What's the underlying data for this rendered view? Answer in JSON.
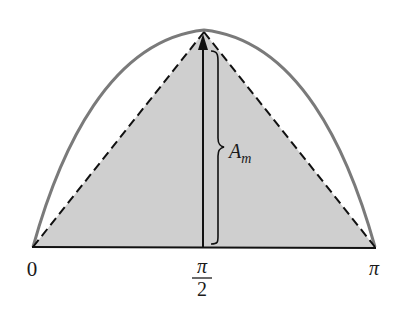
{
  "figure": {
    "type": "diagram",
    "colors": {
      "curve": "#7a7a7a",
      "triangle_fill": "#cfcfcf",
      "lines": "#111111",
      "background": "#ffffff"
    },
    "x_axis": {
      "ticks": [
        {
          "label": "0",
          "position": 0
        },
        {
          "label_numerator": "π",
          "label_denominator": "2",
          "position": 0.5
        },
        {
          "label": "π",
          "position": 1
        }
      ]
    },
    "amplitude_label": {
      "base": "A",
      "subscript": "m"
    },
    "elements": [
      "sine-arch-curve",
      "shaded-triangle",
      "dashed-triangle-sides",
      "baseline",
      "vertical-arrow",
      "curly-brace"
    ]
  }
}
